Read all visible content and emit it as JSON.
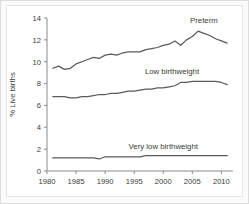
{
  "chart_data": {
    "type": "line",
    "title": "",
    "subtitle": "",
    "xlabel": "",
    "ylabel": "% Live births",
    "xlim": [
      1980,
      2012
    ],
    "ylim": [
      0,
      14
    ],
    "grid": false,
    "legend_position": "inline-annotations",
    "x_ticks": [
      "1980",
      "1985",
      "1990",
      "1995",
      "2000",
      "2005",
      "2010"
    ],
    "x_tick_values": [
      1980,
      1985,
      1990,
      1995,
      2000,
      2005,
      2010
    ],
    "y_ticks": [
      "0",
      "2",
      "4",
      "6",
      "8",
      "10",
      "12",
      "14"
    ],
    "y_tick_values": [
      0,
      2,
      4,
      6,
      8,
      10,
      12,
      14
    ],
    "x": [
      1981,
      1982,
      1983,
      1984,
      1985,
      1986,
      1987,
      1988,
      1989,
      1990,
      1991,
      1992,
      1993,
      1994,
      1995,
      1996,
      1997,
      1998,
      1999,
      2000,
      2001,
      2002,
      2003,
      2004,
      2005,
      2006,
      2007,
      2008,
      2009,
      2010,
      2011
    ],
    "series": [
      {
        "name": "Preterm",
        "color": "#5a5a5a",
        "label_x": 2007.0,
        "label_y": 13.5,
        "values": [
          9.4,
          9.6,
          9.3,
          9.4,
          9.8,
          10.0,
          10.2,
          10.4,
          10.3,
          10.6,
          10.7,
          10.6,
          10.8,
          10.9,
          10.9,
          10.9,
          11.1,
          11.2,
          11.3,
          11.5,
          11.6,
          11.9,
          11.5,
          12.0,
          12.3,
          12.8,
          12.6,
          12.4,
          12.1,
          11.9,
          11.7
        ]
      },
      {
        "name": "Low birthweight",
        "color": "#5a5a5a",
        "label_x": 2001.5,
        "label_y": 8.9,
        "values": [
          6.8,
          6.8,
          6.8,
          6.7,
          6.7,
          6.8,
          6.8,
          6.9,
          7.0,
          7.0,
          7.1,
          7.1,
          7.2,
          7.3,
          7.3,
          7.4,
          7.5,
          7.5,
          7.6,
          7.6,
          7.7,
          7.8,
          8.1,
          8.1,
          8.2,
          8.2,
          8.2,
          8.2,
          8.2,
          8.1,
          7.9
        ]
      },
      {
        "name": "Very low birthweight",
        "color": "#5a5a5a",
        "label_x": 2000.0,
        "label_y": 2.0,
        "values": [
          1.2,
          1.2,
          1.2,
          1.2,
          1.2,
          1.2,
          1.2,
          1.2,
          1.1,
          1.3,
          1.3,
          1.3,
          1.3,
          1.3,
          1.3,
          1.3,
          1.4,
          1.4,
          1.4,
          1.4,
          1.4,
          1.4,
          1.4,
          1.4,
          1.4,
          1.4,
          1.4,
          1.4,
          1.4,
          1.4,
          1.4
        ]
      }
    ]
  }
}
